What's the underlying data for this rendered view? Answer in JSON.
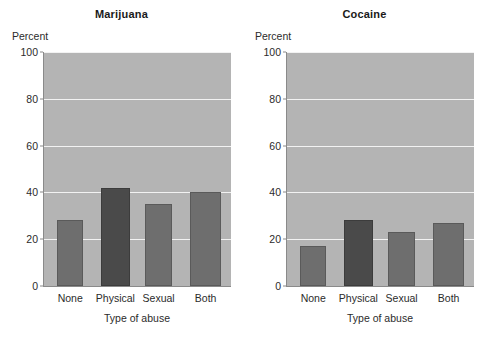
{
  "chart_data": [
    {
      "type": "bar",
      "title": "Marijuana",
      "categories": [
        "None",
        "Physical",
        "Sexual",
        "Both"
      ],
      "values": [
        28,
        42,
        35,
        40
      ],
      "xlabel": "Type of abuse",
      "ylabel": "Percent",
      "ylim": [
        0,
        100
      ],
      "yticks": [
        0,
        20,
        40,
        60,
        80,
        100
      ],
      "grid": true,
      "legend": "none",
      "plot_background": "#b4b4b4",
      "bar_color": "#6e6e6e",
      "highlight_bar_color": "#4a4a4a",
      "highlight_category": "Physical"
    },
    {
      "type": "bar",
      "title": "Cocaine",
      "categories": [
        "None",
        "Physical",
        "Sexual",
        "Both"
      ],
      "values": [
        17,
        28,
        23,
        27
      ],
      "xlabel": "Type of abuse",
      "ylabel": "Percent",
      "ylim": [
        0,
        100
      ],
      "yticks": [
        0,
        20,
        40,
        60,
        80,
        100
      ],
      "grid": true,
      "legend": "none",
      "plot_background": "#b4b4b4",
      "bar_color": "#6e6e6e",
      "highlight_bar_color": "#4a4a4a",
      "highlight_category": "Physical"
    }
  ],
  "panels": [
    {
      "title": "Marijuana",
      "ylabel": "Percent",
      "xlabel": "Type of abuse",
      "yticks": [
        "0",
        "20",
        "40",
        "60",
        "80",
        "100"
      ],
      "xticks": [
        "None",
        "Physical",
        "Sexual",
        "Both"
      ]
    },
    {
      "title": "Cocaine",
      "ylabel": "Percent",
      "xlabel": "Type of abuse",
      "yticks": [
        "0",
        "20",
        "40",
        "60",
        "80",
        "100"
      ],
      "xticks": [
        "None",
        "Physical",
        "Sexual",
        "Both"
      ]
    }
  ]
}
